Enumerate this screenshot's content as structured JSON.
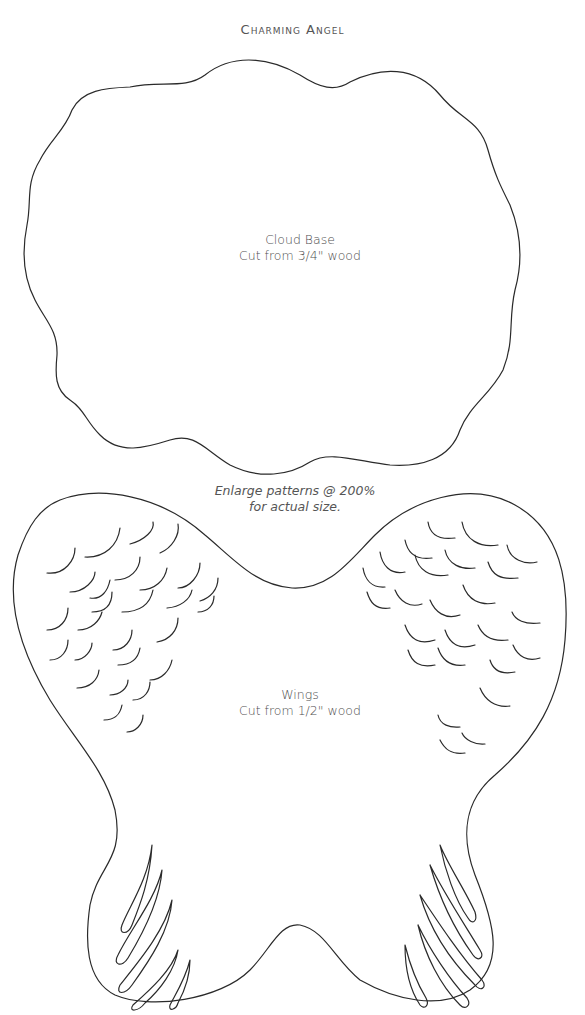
{
  "page": {
    "title": "Charming Angel"
  },
  "patterns": {
    "cloud_base": {
      "name": "Cloud Base",
      "instruction": "Cut from 3/4\" wood"
    },
    "note": {
      "line1": "Enlarge patterns @ 200%",
      "line2": "for actual size."
    },
    "wings": {
      "name": "Wings",
      "instruction": "Cut from 1/2\" wood"
    }
  }
}
